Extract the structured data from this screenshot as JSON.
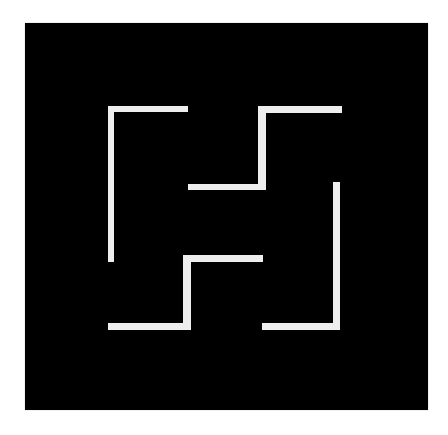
{
  "artwork": {
    "background_color": "#ffffff",
    "panel": {
      "x": 25,
      "y": 23,
      "width": 403,
      "height": 387,
      "color": "#000000"
    },
    "line_color": "#eeeeee",
    "shapes": [
      {
        "name": "top-left-bracket",
        "segments": [
          {
            "x": 108,
            "y": 106,
            "w": 80,
            "h": 6
          },
          {
            "x": 108,
            "y": 106,
            "w": 6,
            "h": 156
          }
        ]
      },
      {
        "name": "top-right-step",
        "segments": [
          {
            "x": 258,
            "y": 106,
            "w": 84,
            "h": 7
          },
          {
            "x": 258,
            "y": 106,
            "w": 8,
            "h": 84
          },
          {
            "x": 188,
            "y": 184,
            "w": 78,
            "h": 6
          }
        ]
      },
      {
        "name": "bottom-left-step",
        "segments": [
          {
            "x": 183,
            "y": 255,
            "w": 80,
            "h": 7
          },
          {
            "x": 183,
            "y": 255,
            "w": 8,
            "h": 75
          },
          {
            "x": 108,
            "y": 323,
            "w": 83,
            "h": 7
          }
        ]
      },
      {
        "name": "bottom-right-bracket",
        "segments": [
          {
            "x": 333,
            "y": 182,
            "w": 7,
            "h": 148
          },
          {
            "x": 262,
            "y": 323,
            "w": 78,
            "h": 7
          }
        ]
      }
    ]
  }
}
